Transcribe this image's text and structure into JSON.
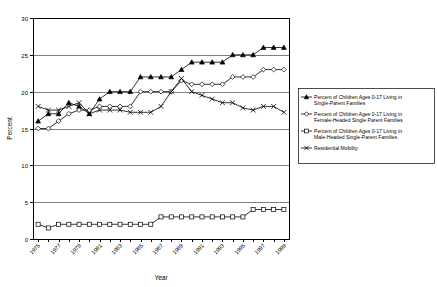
{
  "chart_data": {
    "type": "line",
    "title": "",
    "xlabel": "Year",
    "ylabel": "Percent",
    "ylim": [
      0,
      30
    ],
    "ytick_labels": [
      "0",
      "5",
      "10",
      "15",
      "20",
      "25",
      "30"
    ],
    "ytick_values": [
      0,
      5,
      10,
      15,
      20,
      25,
      30
    ],
    "grid": true,
    "grid_axis": "y",
    "legend_position": "right",
    "x": [
      1975,
      1976,
      1977,
      1978,
      1979,
      1980,
      1981,
      1982,
      1983,
      1984,
      1985,
      1986,
      1987,
      1988,
      1989,
      1990,
      1991,
      1992,
      1993,
      1994,
      1995,
      1996,
      1997,
      1998,
      1999
    ],
    "xtick_labels": [
      "1975",
      "",
      "1977",
      "",
      "1979",
      "",
      "1981",
      "",
      "1983",
      "",
      "1985",
      "",
      "1987",
      "",
      "1989",
      "",
      "1991",
      "",
      "1993",
      "",
      "1995",
      "",
      "1997",
      "",
      "1999"
    ],
    "xtick_labels_shown": [
      "1975",
      "1977",
      "1979",
      "1981",
      "1983",
      "1985",
      "1987",
      "1989",
      "1991",
      "1993",
      "1995",
      "1997",
      "1999"
    ],
    "series": [
      {
        "name": "Percent of Children Ages 0-17 Living in Single-Parent Families",
        "marker": "filled-triangle",
        "values": [
          16,
          17,
          17,
          18.5,
          18,
          17,
          19,
          20,
          20,
          20,
          22,
          22,
          22,
          22,
          23,
          24,
          24,
          24,
          24,
          25,
          25,
          25,
          26,
          26,
          26
        ]
      },
      {
        "name": "Percent of Children Ages 0-17 Living in Female-Headed Single Parent Families",
        "marker": "open-diamond",
        "values": [
          15,
          15,
          16,
          17,
          17.5,
          17.5,
          18,
          18,
          18,
          18,
          20,
          20,
          20,
          20,
          21.5,
          21,
          21,
          21,
          21,
          22,
          22,
          22,
          23,
          23,
          23
        ]
      },
      {
        "name": "Percent of Children Ages 0-17 Living in Male-Headed Single-Parent Families",
        "marker": "open-square",
        "values": [
          2,
          1.5,
          2,
          2,
          2,
          2,
          2,
          2,
          2,
          2,
          2,
          2,
          3,
          3,
          3,
          3,
          3,
          3,
          3,
          3,
          3,
          4,
          4,
          4,
          4
        ]
      },
      {
        "name": "Residential Mobility",
        "marker": "x-cross",
        "values": [
          18,
          17.5,
          17.5,
          18,
          18.5,
          17,
          17.5,
          17.5,
          17.5,
          17.2,
          17.2,
          17.2,
          18,
          20,
          21.8,
          20,
          19.5,
          19,
          18.5,
          18.5,
          17.8,
          17.5,
          18,
          18,
          17.2
        ]
      }
    ]
  }
}
